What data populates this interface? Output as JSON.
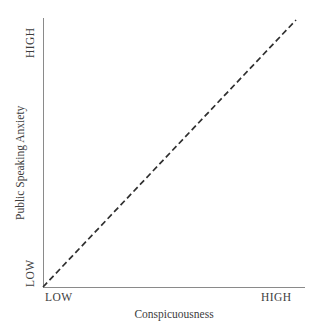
{
  "chart_data": {
    "type": "line",
    "title": "",
    "xlabel": "Conspicuousness",
    "ylabel": "Public Speaking Anxiety",
    "xlim": [
      0,
      1
    ],
    "ylim": [
      0,
      1
    ],
    "xtick_labels": [
      "LOW",
      "HIGH"
    ],
    "ytick_labels": [
      "LOW",
      "HIGH"
    ],
    "grid": false,
    "legend": "none",
    "series": [
      {
        "name": "Conspicuousness vs Public Speaking Anxiety",
        "style": "dashed",
        "color": "#2f2f2f",
        "x": [
          0,
          1
        ],
        "values": [
          0,
          1
        ]
      }
    ],
    "annotations": []
  },
  "axes": {
    "y_title": "Public Speaking Anxiety",
    "x_title": "Conspicuousness",
    "y_tick_high": "HIGH",
    "y_tick_low": "LOW",
    "x_tick_low": "LOW",
    "x_tick_high": "HIGH"
  },
  "colors": {
    "background": "#ffffff",
    "axis": "#8a8a8a",
    "line": "#2f2f2f",
    "text": "#3d3d3d"
  }
}
